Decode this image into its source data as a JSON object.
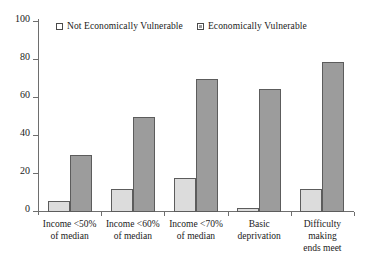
{
  "chart_data": {
    "type": "bar",
    "title": "",
    "subtitle": "",
    "xlabel": "",
    "ylabel": "",
    "ylim": [
      0,
      100
    ],
    "yticks": [
      0,
      20,
      40,
      60,
      80,
      100
    ],
    "grid": false,
    "legend_position": "top-center",
    "categories": [
      "Income <50%\nof median",
      "Income <60%\nof median",
      "Income <70%\nof median",
      "Basic\ndeprivation",
      "Difficulty making\nends meet"
    ],
    "series": [
      {
        "name": "Not Economically Vulnerable",
        "color": "#dcdcdc",
        "values": [
          6,
          12,
          18,
          2,
          12
        ]
      },
      {
        "name": "Economically Vulnerable",
        "color": "#9c9c9c",
        "values": [
          30,
          50,
          70,
          65,
          79
        ]
      }
    ]
  },
  "legend": {
    "entries": [
      {
        "label": "Not Economically Vulnerable"
      },
      {
        "label": "Economically Vulnerable"
      }
    ]
  },
  "axis": {
    "y_tick_labels": [
      "0",
      "20",
      "40",
      "60",
      "80",
      "100"
    ]
  }
}
